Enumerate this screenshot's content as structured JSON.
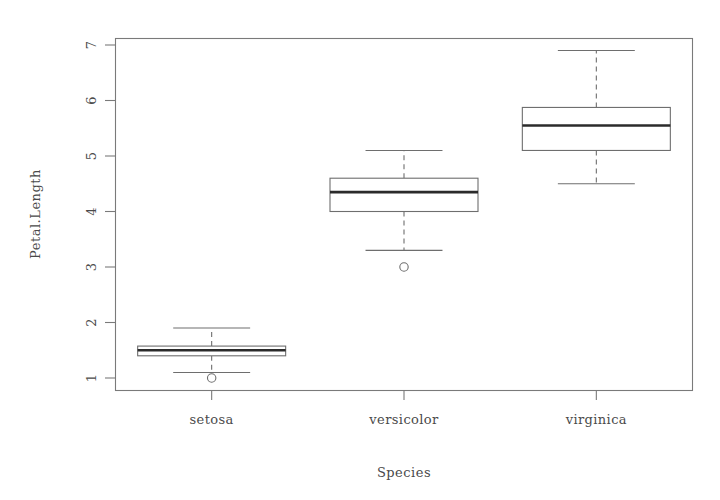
{
  "chart_data": {
    "type": "box",
    "title": "",
    "xlabel": "Species",
    "ylabel": "Petal.Length",
    "categories": [
      "setosa",
      "versicolor",
      "virginica"
    ],
    "ylim": [
      0.8,
      7.1
    ],
    "yticks": [
      1,
      2,
      3,
      4,
      5,
      6,
      7
    ],
    "ytick_labels": [
      "1",
      "2",
      "3",
      "4",
      "5",
      "6",
      "7"
    ],
    "grid": false,
    "legend": "none",
    "boxes": [
      {
        "category": "setosa",
        "whisker_low": 1.1,
        "q1": 1.4,
        "median": 1.5,
        "q3": 1.575,
        "whisker_high": 1.9,
        "outliers": [
          1.0
        ]
      },
      {
        "category": "versicolor",
        "whisker_low": 3.3,
        "q1": 4.0,
        "median": 4.35,
        "q3": 4.6,
        "whisker_high": 5.1,
        "outliers": [
          3.0
        ]
      },
      {
        "category": "virginica",
        "whisker_low": 4.5,
        "q1": 5.1,
        "median": 5.55,
        "q3": 5.875,
        "whisker_high": 6.9,
        "outliers": []
      }
    ]
  },
  "axes": {
    "y_title": "Petal.Length",
    "x_title": "Species",
    "y_tick_text": [
      "1",
      "2",
      "3",
      "4",
      "5",
      "6",
      "7"
    ],
    "x_tick_text": [
      "setosa",
      "versicolor",
      "virginica"
    ]
  },
  "colors": {
    "frame": "#7a7a7a",
    "box_stroke": "#6e6e6e",
    "median": "#2b2b2b",
    "text": "#4a4a4a",
    "background": "#ffffff"
  }
}
